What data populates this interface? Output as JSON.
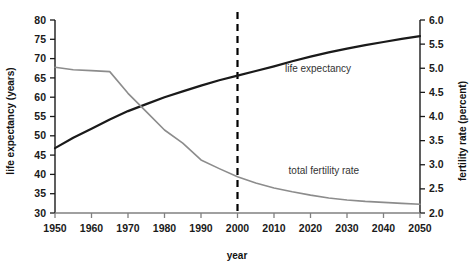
{
  "chart_data": {
    "type": "line",
    "title": "",
    "xlabel": "year",
    "ylabel": "life expectancy (years)",
    "y2label": "fertility rate (percent)",
    "xlim": [
      1950,
      2050
    ],
    "ylim": [
      30,
      80
    ],
    "y2lim": [
      2.0,
      6.0
    ],
    "grid": false,
    "legend_position": "inline-annotation",
    "xticks": [
      1950,
      1960,
      1970,
      1980,
      1990,
      2000,
      2010,
      2020,
      2030,
      2040,
      2050
    ],
    "xtick_labels": [
      "1950",
      "1960",
      "1970",
      "1980",
      "1990",
      "2000",
      "2010",
      "2020",
      "2030",
      "2040",
      "2050"
    ],
    "yticks": [
      30,
      35,
      40,
      45,
      50,
      55,
      60,
      65,
      70,
      75,
      80
    ],
    "ytick_labels": [
      "30",
      "35",
      "40",
      "45",
      "50",
      "55",
      "60",
      "65",
      "70",
      "75",
      "80"
    ],
    "y2ticks": [
      2.0,
      2.5,
      3.0,
      3.5,
      4.0,
      4.5,
      5.0,
      5.5,
      6.0
    ],
    "y2tick_labels": [
      "2.0",
      "2.5",
      "3.0",
      "3.5",
      "4.0",
      "4.5",
      "5.0",
      "5.5",
      "6.0"
    ],
    "annotations": [
      {
        "text": "life expectancy",
        "x": 2013,
        "y": 66.5
      },
      {
        "text": "total fertility rate",
        "x": 2014,
        "y": 40.0
      }
    ],
    "reference_lines": [
      {
        "x": 2000,
        "style": "dashed",
        "color": "#000000",
        "label": ""
      }
    ],
    "series": [
      {
        "name": "life expectancy",
        "axis": "left",
        "color": "#1a1a1a",
        "units": "years",
        "x": [
          1950,
          1955,
          1960,
          1965,
          1970,
          1975,
          1980,
          1985,
          1990,
          1995,
          2000,
          2005,
          2010,
          2015,
          2020,
          2025,
          2030,
          2035,
          2040,
          2045,
          2050
        ],
        "values": [
          46.8,
          49.5,
          51.8,
          54.2,
          56.4,
          58.2,
          60.0,
          61.5,
          63.0,
          64.4,
          65.6,
          66.8,
          68.0,
          69.3,
          70.5,
          71.6,
          72.6,
          73.5,
          74.3,
          75.1,
          75.8
        ]
      },
      {
        "name": "total fertility rate",
        "axis": "right",
        "color": "#8c8c8c",
        "units": "percent",
        "x": [
          1950,
          1955,
          1960,
          1965,
          1970,
          1975,
          1980,
          1985,
          1990,
          1995,
          2000,
          2005,
          2010,
          2015,
          2020,
          2025,
          2030,
          2035,
          2040,
          2045,
          2050
        ],
        "values": [
          5.02,
          4.97,
          4.95,
          4.93,
          4.48,
          4.1,
          3.72,
          3.45,
          3.1,
          2.92,
          2.75,
          2.62,
          2.52,
          2.44,
          2.37,
          2.31,
          2.27,
          2.24,
          2.22,
          2.2,
          2.18
        ]
      }
    ],
    "series_left_scale_equivalent": {
      "note": "fertility series plotted on right axis; equivalent left-axis pixel values",
      "total_fertility_rate": [
        67.8,
        67.1,
        66.9,
        66.6,
        61.0,
        56.3,
        51.5,
        48.1,
        43.8,
        41.5,
        39.4,
        37.8,
        36.5,
        35.5,
        34.6,
        33.9,
        33.4,
        33.0,
        32.8,
        32.5,
        32.3
      ]
    }
  }
}
